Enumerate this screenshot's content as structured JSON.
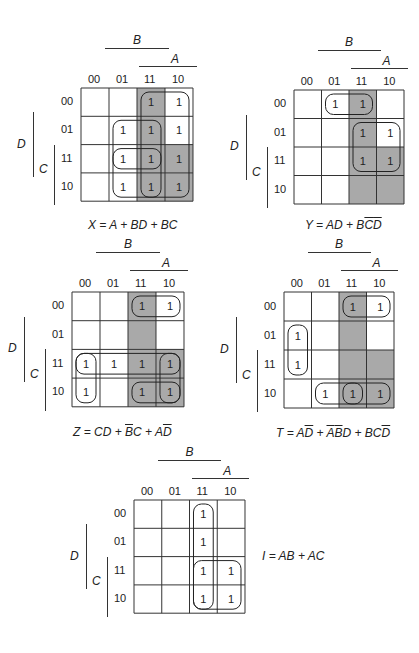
{
  "col_headers": [
    "00",
    "01",
    "11",
    "10"
  ],
  "row_headers": [
    "00",
    "01",
    "11",
    "10"
  ],
  "variables": {
    "B": "B",
    "A": "A",
    "D": "D",
    "C": "C"
  },
  "shade_color": "#a9a9a9",
  "maps": [
    {
      "id": "X",
      "origin": [
        81,
        88
      ],
      "cell": [
        28,
        28.3
      ],
      "cells": [
        [
          0,
          0,
          1,
          1
        ],
        [
          0,
          1,
          1,
          1
        ],
        [
          0,
          1,
          1,
          1
        ],
        [
          0,
          1,
          1,
          1
        ]
      ],
      "shaded": [
        [
          0,
          2
        ],
        [
          1,
          2
        ],
        [
          2,
          2
        ],
        [
          3,
          2
        ],
        [
          2,
          3
        ],
        [
          3,
          3
        ]
      ],
      "groups": [
        [
          0,
          2,
          4,
          2
        ],
        [
          1,
          1,
          2,
          2
        ],
        [
          2,
          1,
          2,
          2
        ]
      ],
      "equation": [
        {
          "t": "X = A + BD + BC"
        }
      ],
      "equation_pos": [
        88,
        218
      ]
    },
    {
      "id": "Y",
      "origin": [
        294,
        90
      ],
      "cell": [
        27.5,
        28.5
      ],
      "cells": [
        [
          0,
          1,
          1,
          0
        ],
        [
          0,
          0,
          1,
          1
        ],
        [
          0,
          0,
          1,
          1
        ],
        [
          0,
          0,
          0,
          0
        ]
      ],
      "shaded": [
        [
          0,
          2
        ],
        [
          1,
          2
        ],
        [
          2,
          2
        ],
        [
          3,
          2
        ],
        [
          2,
          3
        ],
        [
          3,
          3
        ]
      ],
      "groups": [
        [
          0,
          1,
          1,
          2
        ],
        [
          1,
          2,
          2,
          2
        ]
      ],
      "equation": [
        {
          "t": "Y = AD + B"
        },
        {
          "t": "C",
          "ov": true
        },
        {
          "t": "D",
          "ov": true
        }
      ],
      "equation_pos": [
        305,
        218
      ]
    },
    {
      "id": "Z",
      "origin": [
        72,
        292
      ],
      "cell": [
        28,
        28.7
      ],
      "cells": [
        [
          0,
          0,
          1,
          1
        ],
        [
          0,
          0,
          0,
          0
        ],
        [
          1,
          1,
          1,
          1
        ],
        [
          1,
          0,
          1,
          1
        ]
      ],
      "shaded": [
        [
          0,
          2
        ],
        [
          1,
          2
        ],
        [
          2,
          2
        ],
        [
          3,
          2
        ],
        [
          2,
          3
        ],
        [
          3,
          3
        ]
      ],
      "groups": [
        [
          2,
          0,
          1,
          4
        ],
        [
          2,
          0,
          2,
          1
        ],
        [
          0,
          2,
          1,
          2
        ],
        [
          3,
          2,
          1,
          2
        ],
        [
          2,
          3,
          2,
          1
        ]
      ],
      "equation": [
        {
          "t": "Z = CD + "
        },
        {
          "t": "B",
          "ov": true
        },
        {
          "t": "C + A"
        },
        {
          "t": "D",
          "ov": true
        }
      ],
      "equation_pos": [
        73,
        425
      ]
    },
    {
      "id": "T",
      "origin": [
        284,
        292
      ],
      "cell": [
        27.5,
        29
      ],
      "cells": [
        [
          0,
          0,
          1,
          1
        ],
        [
          1,
          0,
          0,
          0
        ],
        [
          1,
          0,
          0,
          0
        ],
        [
          0,
          1,
          1,
          1
        ]
      ],
      "shaded": [
        [
          0,
          2
        ],
        [
          1,
          2
        ],
        [
          2,
          2
        ],
        [
          3,
          2
        ],
        [
          2,
          3
        ],
        [
          3,
          3
        ]
      ],
      "groups": [
        [
          0,
          2,
          1,
          2
        ],
        [
          1,
          0,
          2,
          1
        ],
        [
          3,
          1,
          1,
          2
        ],
        [
          3,
          2,
          1,
          2
        ]
      ],
      "equation": [
        {
          "t": "T = A"
        },
        {
          "t": "D",
          "ov": true
        },
        {
          "t": " + "
        },
        {
          "t": "A",
          "ov": true
        },
        {
          "t": "B",
          "ov": true
        },
        {
          "t": "D + BC"
        },
        {
          "t": "D",
          "ov": true
        }
      ],
      "equation_pos": [
        276,
        426
      ]
    },
    {
      "id": "I",
      "origin": [
        134,
        500
      ],
      "cell": [
        27.75,
        28.3
      ],
      "cells": [
        [
          0,
          0,
          1,
          0
        ],
        [
          0,
          0,
          1,
          0
        ],
        [
          0,
          0,
          1,
          1
        ],
        [
          0,
          0,
          1,
          1
        ]
      ],
      "shaded": [],
      "groups": [
        [
          0,
          2,
          4,
          1
        ],
        [
          2,
          2,
          2,
          2
        ]
      ],
      "equation": [
        {
          "t": "I = AB + AC"
        }
      ],
      "equation_pos": [
        262,
        549
      ]
    }
  ]
}
